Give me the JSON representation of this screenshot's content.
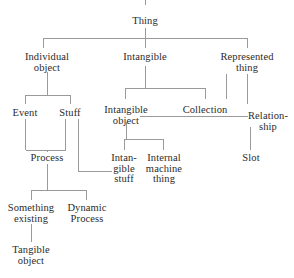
{
  "diagram": {
    "type": "tree",
    "line_color": "#9a9a9a",
    "text_color": "#2b2b2b",
    "background": "#ffffff",
    "nodes": [
      {
        "id": "thing",
        "label": "Thing",
        "x": 145,
        "y": 22
      },
      {
        "id": "individual_object",
        "label": "Individual\nobject",
        "x": 47,
        "y": 58
      },
      {
        "id": "intangible",
        "label": "Intangible",
        "x": 145,
        "y": 58
      },
      {
        "id": "represented_thing",
        "label": "Represented\nthing",
        "x": 247,
        "y": 58
      },
      {
        "id": "event",
        "label": "Event",
        "x": 25,
        "y": 113
      },
      {
        "id": "stuff",
        "label": "Stuff",
        "x": 70,
        "y": 113
      },
      {
        "id": "intangible_object",
        "label": "Intangible\nobject",
        "x": 126,
        "y": 108
      },
      {
        "id": "collection",
        "label": "Collection",
        "x": 205,
        "y": 108
      },
      {
        "id": "relationship",
        "label": "Relation-\nship",
        "x": 266,
        "y": 113
      },
      {
        "id": "process",
        "label": "Process",
        "x": 47,
        "y": 158
      },
      {
        "id": "intangible_stuff",
        "label": "Intan-\ngible\nstuff",
        "x": 124,
        "y": 158
      },
      {
        "id": "internal_machine",
        "label": "Internal\nmachine\nthing",
        "x": 163,
        "y": 158
      },
      {
        "id": "slot",
        "label": "Slot",
        "x": 250,
        "y": 158
      },
      {
        "id": "something_existing",
        "label": "Something\nexisting",
        "x": 31,
        "y": 208
      },
      {
        "id": "dynamic_process",
        "label": "Dynamic\nProcess",
        "x": 86,
        "y": 208
      },
      {
        "id": "tangible_object",
        "label": "Tangible\nobject",
        "x": 31,
        "y": 250
      }
    ],
    "edges": [
      {
        "from": "top-stub",
        "to": "thing",
        "kind": "vertical"
      },
      {
        "from": "thing",
        "to": "individual_object",
        "kind": "bracket"
      },
      {
        "from": "thing",
        "to": "intangible",
        "kind": "bracket"
      },
      {
        "from": "thing",
        "to": "represented_thing",
        "kind": "bracket"
      },
      {
        "from": "individual_object",
        "to": "event",
        "kind": "bracket"
      },
      {
        "from": "individual_object",
        "to": "stuff",
        "kind": "bracket"
      },
      {
        "from": "intangible",
        "to": "intangible_object",
        "kind": "bracket"
      },
      {
        "from": "intangible",
        "to": "collection",
        "kind": "bracket"
      },
      {
        "from": "represented_thing",
        "to": "collection",
        "kind": "vertical"
      },
      {
        "from": "represented_thing",
        "to": "relationship",
        "kind": "vertical"
      },
      {
        "from": "intangible_object",
        "to": "relationship",
        "kind": "horizontal"
      },
      {
        "from": "event",
        "to": "process",
        "kind": "vertical"
      },
      {
        "from": "stuff",
        "to": "process",
        "kind": "vertical"
      },
      {
        "from": "stuff",
        "to": "intangible_stuff",
        "kind": "elbow"
      },
      {
        "from": "intangible_object",
        "to": "intangible_stuff",
        "kind": "bracket"
      },
      {
        "from": "intangible_object",
        "to": "internal_machine",
        "kind": "bracket"
      },
      {
        "from": "relationship",
        "to": "slot",
        "kind": "vertical"
      },
      {
        "from": "process",
        "to": "something_existing",
        "kind": "bracket"
      },
      {
        "from": "process",
        "to": "dynamic_process",
        "kind": "bracket"
      },
      {
        "from": "something_existing",
        "to": "tangible_object",
        "kind": "vertical"
      }
    ]
  }
}
